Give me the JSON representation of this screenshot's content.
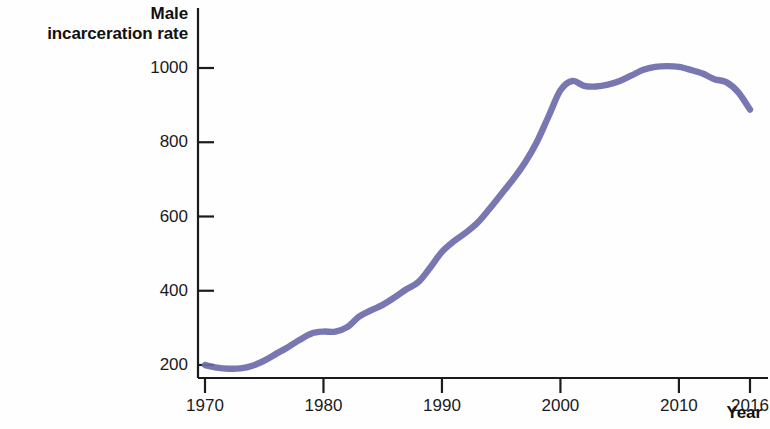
{
  "chart_data": {
    "type": "line",
    "title": "",
    "subtitle": "",
    "xlabel": "Year",
    "ylabel": "Male\nincarceration rate",
    "ylabel_lines": [
      "Male",
      "incarceration rate"
    ],
    "xlim": [
      1970,
      2016
    ],
    "ylim": [
      160,
      1040
    ],
    "grid": false,
    "legend": null,
    "line_color": "#6e6bab",
    "axis_color": "#1b1b1b",
    "xticks": [
      1970,
      1980,
      1990,
      2000,
      2010,
      2016
    ],
    "xtick_labels": [
      "1970",
      "1980",
      "1990",
      "2000",
      "2010",
      "2016"
    ],
    "yticks": [
      200,
      400,
      600,
      800,
      1000
    ],
    "ytick_labels": [
      "200",
      "400",
      "600",
      "800",
      "1000"
    ],
    "series": [
      {
        "name": "Male incarceration rate",
        "color": "#6e6bab",
        "x": [
          1970,
          1971,
          1972,
          1973,
          1974,
          1975,
          1976,
          1977,
          1978,
          1979,
          1980,
          1981,
          1982,
          1983,
          1984,
          1985,
          1986,
          1987,
          1988,
          1989,
          1990,
          1991,
          1992,
          1993,
          1994,
          1995,
          1996,
          1997,
          1998,
          1999,
          2000,
          2001,
          2002,
          2003,
          2004,
          2005,
          2006,
          2007,
          2008,
          2009,
          2010,
          2011,
          2012,
          2013,
          2014,
          2015,
          2016
        ],
        "values": [
          200,
          193,
          190,
          191,
          198,
          212,
          230,
          248,
          268,
          285,
          290,
          290,
          302,
          330,
          347,
          362,
          382,
          404,
          423,
          462,
          505,
          533,
          556,
          583,
          620,
          660,
          700,
          745,
          800,
          870,
          940,
          965,
          952,
          950,
          955,
          965,
          980,
          995,
          1003,
          1005,
          1003,
          995,
          985,
          970,
          962,
          935,
          888
        ]
      }
    ],
    "annotations": []
  },
  "figure": {
    "background": "#ffffff",
    "width": 770,
    "height": 429
  }
}
